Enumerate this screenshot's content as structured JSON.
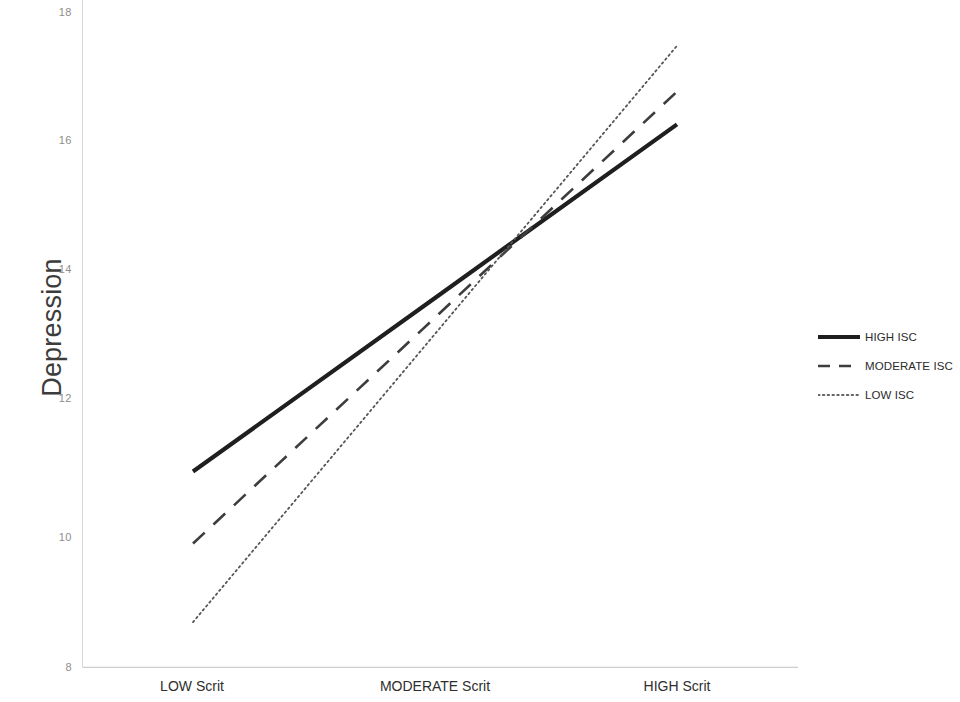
{
  "chart_data": {
    "type": "line",
    "title": "",
    "subtitle": "",
    "xlabel": "",
    "ylabel": "Depression",
    "categories": [
      "LOW Scrit",
      "MODERATE Scrit",
      "HIGH Scrit"
    ],
    "x": [
      0,
      1,
      2
    ],
    "ylim": [
      8,
      18
    ],
    "xlim": [
      -0.35,
      2.35
    ],
    "y_ticks": [
      8,
      10,
      12,
      14,
      16,
      18
    ],
    "y_tick_labels": [
      "8",
      "10",
      "12",
      "14",
      "16",
      "18"
    ],
    "grid": false,
    "legend_position": "right",
    "series": [
      {
        "name": "HIGH ISC",
        "values": [
          11.0,
          13.65,
          16.3
        ],
        "style": "solid",
        "color": "#1f1f1f",
        "width": 4.2
      },
      {
        "name": "MODERATE ISC",
        "values": [
          9.9,
          13.35,
          16.8
        ],
        "style": "dashed",
        "color": "#3d3d3d",
        "width": 2.6
      },
      {
        "name": "LOW ISC",
        "values": [
          8.7,
          13.1,
          17.5
        ],
        "style": "dotted",
        "color": "#555555",
        "width": 1.8
      }
    ]
  },
  "axes": {
    "y_title": "Depression",
    "y_tick_labels": [
      "18",
      "16",
      "14",
      "12",
      "10",
      "8"
    ],
    "x_tick_labels": [
      "LOW Scrit",
      "MODERATE Scrit",
      "HIGH Scrit"
    ],
    "axis_color": "#cfcfcf"
  },
  "legend": {
    "items": [
      {
        "label": "HIGH ISC",
        "style": "solid"
      },
      {
        "label": "MODERATE ISC",
        "style": "dashed"
      },
      {
        "label": "LOW ISC",
        "style": "dotted"
      }
    ]
  },
  "colors": {
    "background": "#ffffff",
    "line_high": "#1f1f1f",
    "line_moderate": "#3d3d3d",
    "line_low": "#555555",
    "tick_text": "#8d8d8d",
    "label_text": "#2e2e2e",
    "axis": "#cfcfcf"
  }
}
